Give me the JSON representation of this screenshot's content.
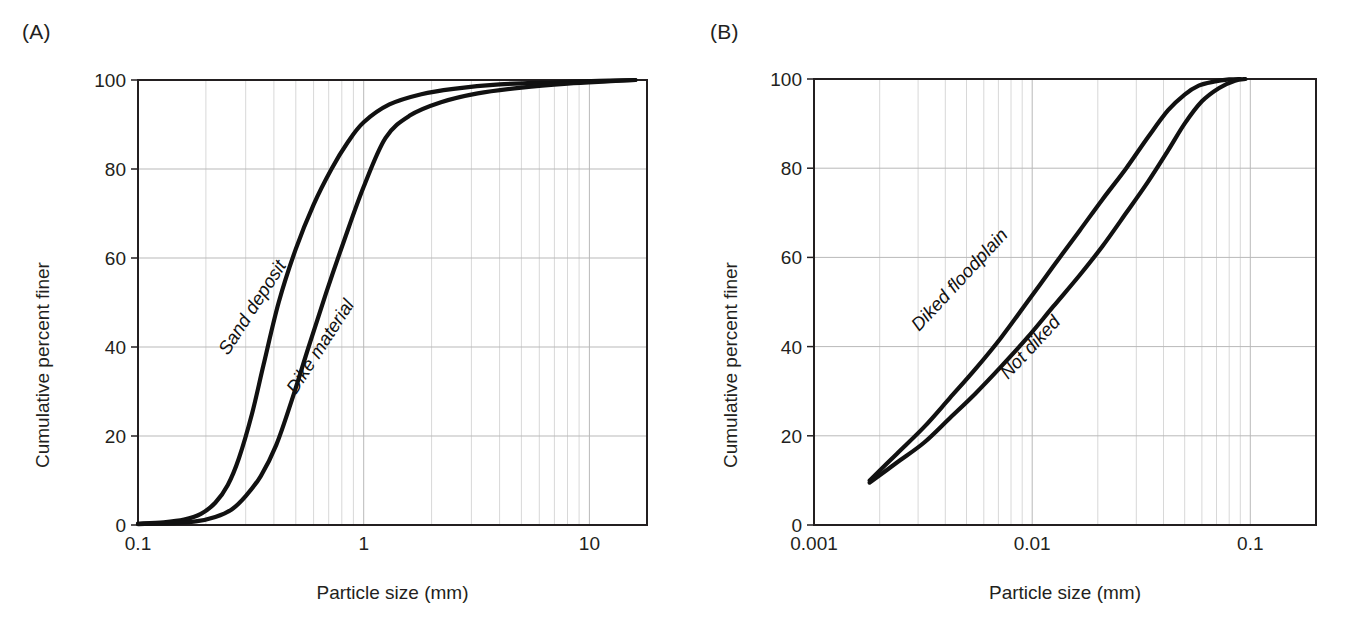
{
  "figure": {
    "background": "#ffffff",
    "curve_color": "#111111",
    "grid_major_color": "#b9b9b9",
    "grid_minor_color": "#d8d8d8",
    "axis_color": "#231f20"
  },
  "panels": [
    {
      "letter": "(A)",
      "xlabel": "Particle size (mm)",
      "ylabel": "Cumulative percent finer",
      "xticks": [
        "0.1",
        "1",
        "10"
      ],
      "yticks": [
        "0",
        "20",
        "40",
        "60",
        "80",
        "100"
      ],
      "curve_labels": [
        "Sand deposit",
        "Dike material"
      ]
    },
    {
      "letter": "(B)",
      "xlabel": "Particle size (mm)",
      "ylabel": "Cumulative percent finer",
      "xticks": [
        "0.001",
        "0.01",
        "0.1"
      ],
      "yticks": [
        "0",
        "20",
        "40",
        "60",
        "80",
        "100"
      ],
      "curve_labels": [
        "Diked floodplain",
        "Not diked"
      ]
    }
  ],
  "chart_data": [
    {
      "type": "line",
      "panel": "(A)",
      "title": "(A)",
      "xlabel": "Particle size (mm)",
      "ylabel": "Cumulative percent finer",
      "xscale": "log",
      "xlim": [
        0.1,
        18
      ],
      "ylim": [
        0,
        100
      ],
      "xtick_values": [
        0.1,
        1,
        10
      ],
      "xtick_labels": [
        "0.1",
        "1",
        "10"
      ],
      "ytick_values": [
        0,
        20,
        40,
        60,
        80,
        100
      ],
      "ytick_labels": [
        "0",
        "20",
        "40",
        "60",
        "80",
        "100"
      ],
      "grid": "major and minor (log decades) shown, light gray",
      "legend": "inline curve labels, no legend box",
      "series": [
        {
          "name": "Sand deposit",
          "x": [
            0.1,
            0.13,
            0.16,
            0.19,
            0.22,
            0.25,
            0.28,
            0.32,
            0.36,
            0.42,
            0.5,
            0.6,
            0.72,
            0.85,
            1.0,
            1.3,
            1.8,
            2.5,
            4.0,
            7.0,
            11.0,
            16.0
          ],
          "y": [
            0.3,
            0.6,
            1.2,
            2.5,
            5.0,
            9.0,
            15.0,
            25.0,
            36.0,
            50.0,
            62.0,
            72.0,
            80.0,
            86.0,
            90.5,
            94.5,
            96.8,
            98.0,
            99.0,
            99.5,
            99.8,
            100.0
          ]
        },
        {
          "name": "Dike material",
          "x": [
            0.1,
            0.14,
            0.18,
            0.22,
            0.26,
            0.3,
            0.35,
            0.41,
            0.48,
            0.57,
            0.68,
            0.82,
            1.0,
            1.25,
            1.6,
            2.2,
            3.2,
            5.0,
            8.0,
            12.0,
            16.0
          ],
          "y": [
            0.2,
            0.4,
            0.8,
            1.8,
            3.5,
            6.5,
            11.0,
            18.0,
            28.0,
            40.0,
            52.0,
            64.0,
            76.0,
            87.0,
            92.0,
            95.0,
            97.0,
            98.3,
            99.2,
            99.7,
            100.0
          ]
        }
      ]
    },
    {
      "type": "line",
      "panel": "(B)",
      "title": "(B)",
      "xlabel": "Particle size (mm)",
      "ylabel": "Cumulative percent finer",
      "xscale": "log",
      "xlim": [
        0.001,
        0.2
      ],
      "ylim": [
        0,
        100
      ],
      "xtick_values": [
        0.001,
        0.01,
        0.1
      ],
      "xtick_labels": [
        "0.001",
        "0.01",
        "0.1"
      ],
      "ytick_values": [
        0,
        20,
        40,
        60,
        80,
        100
      ],
      "ytick_labels": [
        "0",
        "20",
        "40",
        "60",
        "80",
        "100"
      ],
      "grid": "major and minor (log decades) shown, light gray",
      "legend": "inline curve labels, no legend box",
      "series": [
        {
          "name": "Diked floodplain",
          "x": [
            0.0018,
            0.0024,
            0.0032,
            0.0042,
            0.0055,
            0.0072,
            0.0095,
            0.0125,
            0.0165,
            0.021,
            0.027,
            0.034,
            0.042,
            0.05,
            0.058,
            0.068,
            0.08,
            0.09
          ],
          "y": [
            10.0,
            16.0,
            22.0,
            28.5,
            35.0,
            42.0,
            50.0,
            58.0,
            66.0,
            73.0,
            80.0,
            87.0,
            93.0,
            96.5,
            98.5,
            99.4,
            99.9,
            100.0
          ]
        },
        {
          "name": "Not diked",
          "x": [
            0.0018,
            0.0024,
            0.0032,
            0.0042,
            0.0055,
            0.0072,
            0.0095,
            0.0125,
            0.0165,
            0.021,
            0.027,
            0.034,
            0.042,
            0.05,
            0.06,
            0.072,
            0.085,
            0.095
          ],
          "y": [
            9.5,
            14.0,
            18.5,
            24.0,
            29.5,
            35.5,
            42.0,
            49.0,
            56.0,
            62.5,
            70.0,
            77.0,
            84.0,
            90.0,
            95.0,
            98.0,
            99.6,
            100.0
          ]
        }
      ]
    }
  ]
}
